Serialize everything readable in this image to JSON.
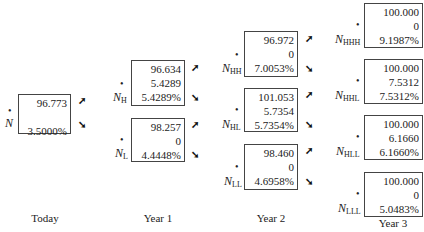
{
  "periods": [
    "Today",
    "Year 1",
    "Year 2",
    "Year 3"
  ],
  "nodes": {
    "N": {
      "name": "N",
      "sub": "",
      "price": "96.773",
      "cashflow": "",
      "rate": "3.5000%"
    },
    "NH": {
      "name": "N",
      "sub": "H",
      "price": "96.634",
      "cashflow": "5.4289",
      "rate": "5.4289%"
    },
    "NL": {
      "name": "N",
      "sub": "L",
      "price": "98.257",
      "cashflow": "0",
      "rate": "4.4448%"
    },
    "NHH": {
      "name": "N",
      "sub": "HH",
      "price": "96.972",
      "cashflow": "0",
      "rate": "7.0053%"
    },
    "NHL": {
      "name": "N",
      "sub": "HL",
      "price": "101.053",
      "cashflow": "5.7354",
      "rate": "5.7354%"
    },
    "NLL": {
      "name": "N",
      "sub": "LL",
      "price": "98.460",
      "cashflow": "0",
      "rate": "4.6958%"
    },
    "NHHH": {
      "name": "N",
      "sub": "HHH",
      "price": "100.000",
      "cashflow": "0",
      "rate": "9.1987%"
    },
    "NHHL": {
      "name": "N",
      "sub": "HHL",
      "price": "100.000",
      "cashflow": "7.5312",
      "rate": "7.5312%"
    },
    "NHLL": {
      "name": "N",
      "sub": "HLL",
      "price": "100.000",
      "cashflow": "6.1660",
      "rate": "6.1660%"
    },
    "NLLL": {
      "name": "N",
      "sub": "LLL",
      "price": "100.000",
      "cashflow": "0",
      "rate": "5.0483%"
    }
  },
  "glyphs": {
    "dot": "•",
    "arrow_up": "➚",
    "arrow_down": "➘"
  }
}
